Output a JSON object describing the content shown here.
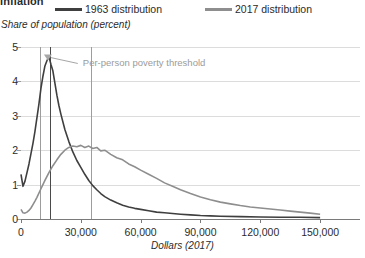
{
  "title_partial": "inflation",
  "legend": {
    "items": [
      {
        "label": "1963 distribution",
        "color": "#3f3f3f"
      },
      {
        "label": "2017 distribution",
        "color": "#8e8e8e"
      }
    ]
  },
  "annotation": {
    "text": "Per-person poverty threshold",
    "color": "#9b9b9b"
  },
  "chart_data": {
    "type": "line",
    "title": "inflation",
    "xlabel": "Dollars (2017)",
    "ylabel": "Share of population (percent)",
    "xlim": [
      0,
      170000
    ],
    "ylim": [
      0,
      5
    ],
    "xticks": [
      0,
      30000,
      60000,
      90000,
      120000,
      150000
    ],
    "xtick_labels": [
      "0",
      "30,000",
      "60,000",
      "90,000",
      "120,000",
      "150,000"
    ],
    "yticks": [
      0,
      1,
      2,
      3,
      4,
      5
    ],
    "ytick_labels": [
      "0",
      "1",
      "2",
      "3",
      "4",
      "5"
    ],
    "grid": true,
    "legend_position": "top",
    "annotations": [
      {
        "text": "Per-person poverty threshold",
        "x": 30000,
        "y": 4.55,
        "points_to_x": 13500,
        "points_to_y": 4.75
      }
    ],
    "vlines": [
      {
        "x": 9500,
        "color": "#9d9d9d",
        "label": "1963 poverty threshold"
      },
      {
        "x": 14500,
        "color": "#4a4a4a",
        "label": "1963 median marker"
      },
      {
        "x": 35000,
        "color": "#9d9d9d",
        "label": "2017 poverty threshold"
      }
    ],
    "series": [
      {
        "name": "1963 distribution",
        "color": "#3f3f3f",
        "x": [
          0,
          1000,
          2000,
          3000,
          4000,
          5000,
          6000,
          7000,
          8000,
          9000,
          10000,
          11000,
          12000,
          13000,
          14000,
          15000,
          16000,
          17000,
          18000,
          19000,
          20000,
          22000,
          24000,
          26000,
          28000,
          30000,
          32000,
          34000,
          36000,
          38000,
          40000,
          42000,
          45000,
          48000,
          51000,
          54000,
          57000,
          60000,
          64000,
          68000,
          72000,
          76000,
          80000,
          85000,
          90000,
          95000,
          100000,
          110000,
          120000,
          130000,
          140000,
          150000
        ],
        "y": [
          1.3,
          0.95,
          1.1,
          1.35,
          1.6,
          1.9,
          2.2,
          2.55,
          2.95,
          3.35,
          3.8,
          4.15,
          4.45,
          4.6,
          4.72,
          4.5,
          4.3,
          3.95,
          3.6,
          3.3,
          3.05,
          2.6,
          2.25,
          1.95,
          1.7,
          1.5,
          1.3,
          1.12,
          0.97,
          0.85,
          0.74,
          0.65,
          0.55,
          0.47,
          0.4,
          0.35,
          0.31,
          0.28,
          0.24,
          0.2,
          0.18,
          0.16,
          0.14,
          0.12,
          0.1,
          0.09,
          0.08,
          0.07,
          0.06,
          0.05,
          0.05,
          0.04
        ]
      },
      {
        "name": "2017 distribution",
        "color": "#8e8e8e",
        "x": [
          0,
          1000,
          2000,
          3000,
          4000,
          5000,
          6000,
          7000,
          8000,
          10000,
          12000,
          14000,
          16000,
          18000,
          20000,
          22000,
          24000,
          26000,
          28000,
          30000,
          32000,
          34000,
          36000,
          38000,
          40000,
          42000,
          45000,
          48000,
          51000,
          54000,
          57000,
          60000,
          64000,
          68000,
          72000,
          76000,
          80000,
          85000,
          90000,
          95000,
          100000,
          105000,
          110000,
          115000,
          120000,
          125000,
          130000,
          135000,
          140000,
          145000,
          150000
        ],
        "y": [
          0.28,
          0.18,
          0.17,
          0.2,
          0.25,
          0.32,
          0.42,
          0.52,
          0.63,
          0.88,
          1.12,
          1.35,
          1.55,
          1.72,
          1.88,
          2.0,
          2.08,
          2.12,
          2.1,
          2.14,
          2.08,
          2.12,
          2.05,
          2.08,
          1.98,
          2.0,
          1.88,
          1.78,
          1.72,
          1.6,
          1.52,
          1.42,
          1.3,
          1.18,
          1.05,
          0.95,
          0.85,
          0.74,
          0.64,
          0.56,
          0.49,
          0.44,
          0.39,
          0.35,
          0.32,
          0.29,
          0.26,
          0.23,
          0.2,
          0.17,
          0.14
        ]
      }
    ]
  }
}
